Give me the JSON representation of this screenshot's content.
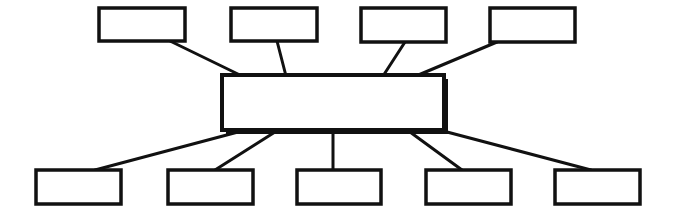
{
  "diagram": {
    "type": "hub-and-spoke",
    "stroke_color": "#111111",
    "background_color": "#ffffff",
    "center": {
      "label": "",
      "x": 222,
      "y": 75,
      "w": 222,
      "h": 55,
      "shadow": true
    },
    "top_nodes": [
      {
        "label": "",
        "x": 99,
        "y": 8,
        "w": 86,
        "h": 33,
        "anchor": [
          170,
          41
        ],
        "hub": [
          242,
          76
        ]
      },
      {
        "label": "",
        "x": 231,
        "y": 8,
        "w": 86,
        "h": 33,
        "anchor": [
          277,
          41
        ],
        "hub": [
          286,
          76
        ]
      },
      {
        "label": "",
        "x": 361,
        "y": 8,
        "w": 85,
        "h": 34,
        "anchor": [
          405,
          42
        ],
        "hub": [
          383,
          76
        ]
      },
      {
        "label": "",
        "x": 490,
        "y": 8,
        "w": 85,
        "h": 34,
        "anchor": [
          497,
          42
        ],
        "hub": [
          416,
          76
        ]
      }
    ],
    "bottom_nodes": [
      {
        "label": "",
        "x": 36,
        "y": 170,
        "w": 85,
        "h": 34,
        "anchor": [
          95,
          170
        ],
        "hub": [
          238,
          132
        ]
      },
      {
        "label": "",
        "x": 168,
        "y": 170,
        "w": 85,
        "h": 34,
        "anchor": [
          215,
          170
        ],
        "hub": [
          275,
          132
        ]
      },
      {
        "label": "",
        "x": 297,
        "y": 170,
        "w": 84,
        "h": 34,
        "anchor": [
          333,
          170
        ],
        "hub": [
          333,
          132
        ]
      },
      {
        "label": "",
        "x": 426,
        "y": 170,
        "w": 85,
        "h": 34,
        "anchor": [
          462,
          170
        ],
        "hub": [
          410,
          132
        ]
      },
      {
        "label": "",
        "x": 555,
        "y": 170,
        "w": 85,
        "h": 34,
        "anchor": [
          591,
          170
        ],
        "hub": [
          447,
          132
        ]
      }
    ]
  }
}
